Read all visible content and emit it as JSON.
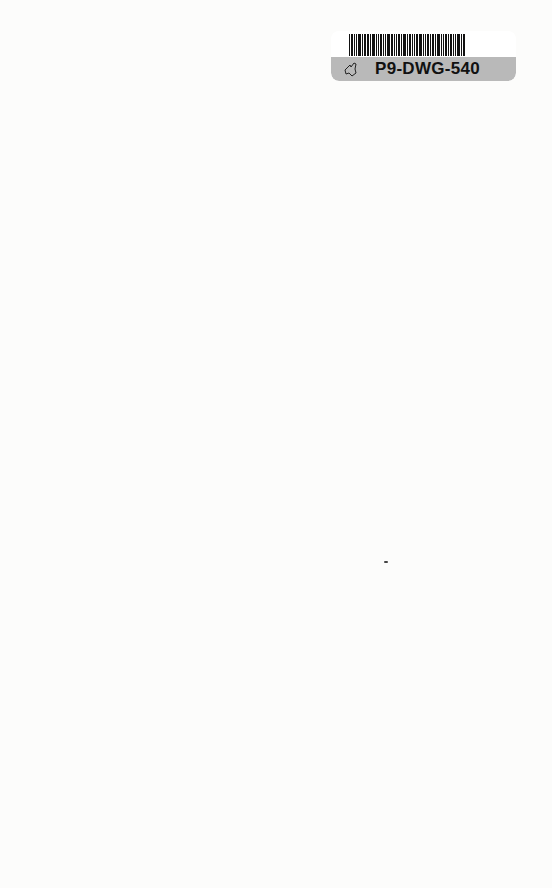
{
  "document": {
    "type": "scanned-book-endpaper",
    "background_color": "#fcfcfb"
  },
  "library_label": {
    "barcode": "P9-DWG-540",
    "code_text": "P9-DWG-540",
    "icon": "state-outline-icon",
    "band_color": "#b9b9b9"
  },
  "stamp": {
    "text": "",
    "legible": false
  }
}
